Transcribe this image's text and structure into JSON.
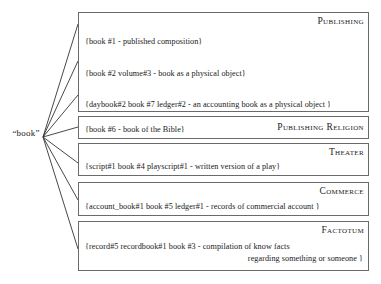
{
  "diagram": {
    "lemma": "“book”",
    "edge_color": "#333333",
    "box_border_color": "#6a6a6a",
    "senses": [
      {
        "domain": "Publishing",
        "domain_placement": "stacked",
        "lines": [
          {
            "text": "{book #1  - published composition}"
          },
          {
            "text": "{book #2 volume#3      - book as  a physical object}"
          },
          {
            "text": "{daybook#2      book #7 ledger#2        - an accounting book as a physical object }"
          }
        ]
      },
      {
        "domain": "Publishing  Religion",
        "domain_placement": "inline",
        "lines": [
          {
            "text": "{book #6  - book of the Bible}"
          }
        ]
      },
      {
        "domain": "Theater",
        "domain_placement": "stacked",
        "lines": [
          {
            "text": "{script#1        book #4 playscript#1           - written version of a play}"
          }
        ]
      },
      {
        "domain": "Commerce",
        "domain_placement": "stacked",
        "lines": [
          {
            "text": "{account_book#1         book #5 ledger#1      - records of commercial account }"
          }
        ]
      },
      {
        "domain": "Factotum",
        "domain_placement": "stacked",
        "lines": [
          {
            "text": "{record#5 recordbook#1              book #3  - compilation of know facts"
          },
          {
            "text": "regarding something or someone }",
            "align": "right"
          }
        ]
      }
    ]
  }
}
